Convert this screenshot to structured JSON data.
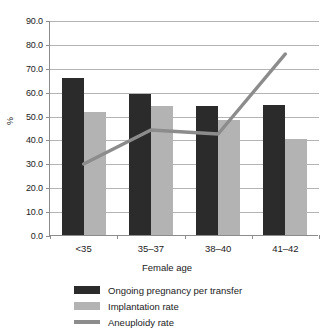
{
  "chart_data": {
    "type": "bar",
    "title": "",
    "categories": [
      "<35",
      "35–37",
      "38–40",
      "41–42"
    ],
    "xlabel": "Female age",
    "ylabel": "%",
    "ylim": [
      0,
      90
    ],
    "ytick_step": 10,
    "ytick_labels": [
      "0.0",
      "10.0",
      "20.0",
      "30.0",
      "40.0",
      "50.0",
      "60.0",
      "70.0",
      "80.0",
      "90.0"
    ],
    "grid": true,
    "legend_position": "bottom-center",
    "series": [
      {
        "name": "Ongoing pregnancy per transfer",
        "type": "bar",
        "color": "#2b2b2b",
        "values": [
          65.7,
          59.0,
          54.0,
          54.4
        ]
      },
      {
        "name": "Implantation rate",
        "type": "bar",
        "color": "#b3b3b3",
        "values": [
          51.5,
          54.0,
          48.1,
          40.2
        ]
      },
      {
        "name": "Aneuploidy rate",
        "type": "line",
        "color": "#8c8c8c",
        "values": [
          30.1,
          44.4,
          42.7,
          76.2
        ]
      }
    ]
  },
  "legend": {
    "items": [
      {
        "label": "Ongoing pregnancy per transfer",
        "color": "#2b2b2b",
        "marker": "bar"
      },
      {
        "label": "Implantation rate",
        "color": "#b3b3b3",
        "marker": "bar"
      },
      {
        "label": "Aneuploidy rate",
        "color": "#8c8c8c",
        "marker": "line"
      }
    ]
  }
}
